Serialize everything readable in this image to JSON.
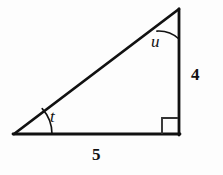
{
  "figure": {
    "kind": "right-triangle-diagram",
    "background_color": "#fdfdfd",
    "stroke_color": "#111111",
    "stroke_width": 2.6,
    "canvas": {
      "width": 223,
      "height": 175
    },
    "vertices": {
      "left": {
        "x": 14,
        "y": 134,
        "name": "angle-t-vertex"
      },
      "bottom_right": {
        "x": 179,
        "y": 134,
        "name": "right-angle-vertex"
      },
      "apex": {
        "x": 179,
        "y": 9,
        "name": "angle-u-vertex"
      }
    },
    "sides": [
      {
        "name": "base",
        "from": "left",
        "to": "bottom_right",
        "label": "5"
      },
      {
        "name": "vertical-leg",
        "from": "bottom_right",
        "to": "apex",
        "label": "4"
      },
      {
        "name": "hypotenuse",
        "from": "left",
        "to": "apex",
        "label": ""
      }
    ],
    "right_angle_marker": {
      "present": true,
      "size": 16,
      "x": 162,
      "y": 118
    },
    "angles": [
      {
        "symbol": "t",
        "at": "left",
        "arc_radius": 38
      },
      {
        "symbol": "u",
        "at": "apex",
        "arc_radius": 30
      }
    ],
    "labels": {
      "angle_t": "t",
      "angle_u": "u",
      "side_vertical": "4",
      "side_base": "5"
    }
  }
}
